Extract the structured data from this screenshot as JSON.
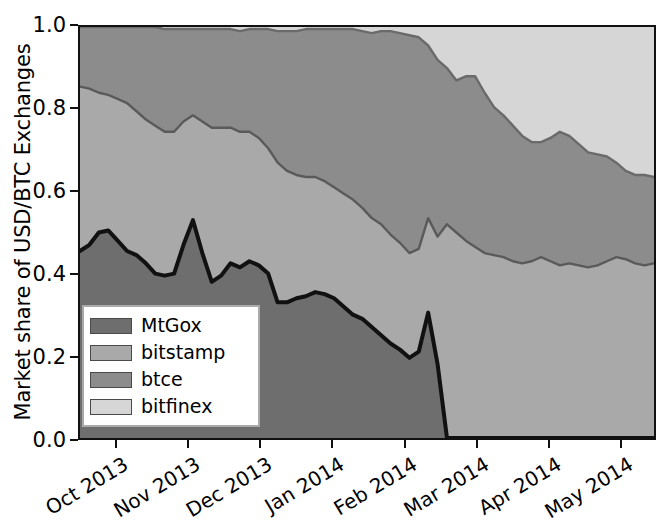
{
  "chart_data": {
    "type": "area",
    "title": "",
    "subtitle": "",
    "xlabel": "",
    "ylabel": "Market share of USD/BTC Exchanges",
    "stacked": true,
    "grid": false,
    "legend_position": "lower-left",
    "ylim": [
      0.0,
      1.0
    ],
    "ytick_labels": [
      "0.0",
      "0.2",
      "0.4",
      "0.6",
      "0.8",
      "1.0"
    ],
    "ytick_values": [
      0.0,
      0.2,
      0.4,
      0.6,
      0.8,
      1.0
    ],
    "xtick_labels": [
      "Oct 2013",
      "Nov 2013",
      "Dec 2013",
      "Jan 2014",
      "Feb 2014",
      "Mar 2014",
      "Apr 2014",
      "May 2014"
    ],
    "x": [
      "2013-09-25",
      "2013-10-01",
      "2013-10-05",
      "2013-10-09",
      "2013-10-13",
      "2013-10-17",
      "2013-10-21",
      "2013-10-25",
      "2013-10-29",
      "2013-11-02",
      "2013-11-06",
      "2013-11-10",
      "2013-11-14",
      "2013-11-18",
      "2013-11-22",
      "2013-11-26",
      "2013-11-30",
      "2013-12-04",
      "2013-12-08",
      "2013-12-12",
      "2013-12-16",
      "2013-12-20",
      "2013-12-24",
      "2013-12-28",
      "2014-01-01",
      "2014-01-05",
      "2014-01-09",
      "2014-01-13",
      "2014-01-17",
      "2014-01-21",
      "2014-01-25",
      "2014-01-29",
      "2014-02-02",
      "2014-02-06",
      "2014-02-10",
      "2014-02-14",
      "2014-02-18",
      "2014-02-22",
      "2014-02-26",
      "2014-03-02",
      "2014-03-06",
      "2014-03-10",
      "2014-03-14",
      "2014-03-18",
      "2014-03-22",
      "2014-03-26",
      "2014-03-30",
      "2014-04-03",
      "2014-04-07",
      "2014-04-11",
      "2014-04-15",
      "2014-04-19",
      "2014-04-23",
      "2014-04-27",
      "2014-05-01",
      "2014-05-05",
      "2014-05-09",
      "2014-05-13",
      "2014-05-17",
      "2014-05-21",
      "2014-05-25",
      "2014-05-29"
    ],
    "series": [
      {
        "name": "MtGox",
        "color": "#6e6e6e",
        "values": [
          0.455,
          0.47,
          0.5,
          0.505,
          0.48,
          0.455,
          0.445,
          0.425,
          0.4,
          0.395,
          0.4,
          0.47,
          0.53,
          0.45,
          0.38,
          0.395,
          0.425,
          0.415,
          0.43,
          0.42,
          0.4,
          0.33,
          0.33,
          0.34,
          0.345,
          0.355,
          0.35,
          0.34,
          0.32,
          0.3,
          0.29,
          0.27,
          0.25,
          0.23,
          0.215,
          0.195,
          0.21,
          0.305,
          0.18,
          0.0,
          0.0,
          0.0,
          0.0,
          0.0,
          0.0,
          0.0,
          0.0,
          0.0,
          0.0,
          0.0,
          0.0,
          0.0,
          0.0,
          0.0,
          0.0,
          0.0,
          0.0,
          0.0,
          0.0,
          0.0,
          0.0,
          0.0
        ]
      },
      {
        "name": "bitstamp",
        "color": "#a9a9a9",
        "values": [
          0.4,
          0.38,
          0.34,
          0.33,
          0.345,
          0.36,
          0.35,
          0.35,
          0.36,
          0.35,
          0.345,
          0.3,
          0.255,
          0.32,
          0.375,
          0.36,
          0.33,
          0.33,
          0.315,
          0.31,
          0.305,
          0.34,
          0.32,
          0.3,
          0.29,
          0.28,
          0.275,
          0.27,
          0.275,
          0.28,
          0.27,
          0.265,
          0.27,
          0.265,
          0.26,
          0.255,
          0.25,
          0.23,
          0.31,
          0.52,
          0.5,
          0.48,
          0.465,
          0.45,
          0.445,
          0.44,
          0.43,
          0.425,
          0.43,
          0.44,
          0.43,
          0.42,
          0.425,
          0.42,
          0.415,
          0.42,
          0.43,
          0.44,
          0.435,
          0.425,
          0.42,
          0.425
        ]
      },
      {
        "name": "btce",
        "color": "#8c8c8c",
        "values": [
          0.145,
          0.15,
          0.16,
          0.165,
          0.175,
          0.185,
          0.205,
          0.225,
          0.24,
          0.25,
          0.25,
          0.225,
          0.21,
          0.225,
          0.24,
          0.24,
          0.24,
          0.245,
          0.25,
          0.265,
          0.29,
          0.32,
          0.34,
          0.35,
          0.36,
          0.36,
          0.37,
          0.385,
          0.4,
          0.415,
          0.43,
          0.45,
          0.47,
          0.495,
          0.51,
          0.53,
          0.515,
          0.42,
          0.43,
          0.38,
          0.37,
          0.4,
          0.415,
          0.39,
          0.36,
          0.345,
          0.33,
          0.31,
          0.29,
          0.28,
          0.3,
          0.325,
          0.31,
          0.295,
          0.28,
          0.27,
          0.255,
          0.23,
          0.215,
          0.215,
          0.22,
          0.21
        ]
      },
      {
        "name": "bitfinex",
        "color": "#d6d6d6",
        "values": [
          0.0,
          0.0,
          0.0,
          0.0,
          0.0,
          0.0,
          0.0,
          0.0,
          0.0,
          0.005,
          0.005,
          0.005,
          0.005,
          0.005,
          0.005,
          0.005,
          0.005,
          0.01,
          0.005,
          0.005,
          0.005,
          0.01,
          0.01,
          0.01,
          0.005,
          0.005,
          0.005,
          0.005,
          0.005,
          0.005,
          0.01,
          0.015,
          0.01,
          0.01,
          0.015,
          0.02,
          0.025,
          0.045,
          0.08,
          0.1,
          0.13,
          0.12,
          0.12,
          0.16,
          0.195,
          0.215,
          0.24,
          0.265,
          0.28,
          0.28,
          0.27,
          0.255,
          0.265,
          0.285,
          0.305,
          0.31,
          0.315,
          0.33,
          0.35,
          0.36,
          0.36,
          0.365
        ]
      }
    ]
  },
  "legend": {
    "entries": [
      {
        "label": "MtGox",
        "color": "#6e6e6e"
      },
      {
        "label": "bitstamp",
        "color": "#a9a9a9"
      },
      {
        "label": "btce",
        "color": "#8c8c8c"
      },
      {
        "label": "bitfinex",
        "color": "#d6d6d6"
      }
    ]
  },
  "axes": {
    "y_label": "Market share of USD/BTC Exchanges",
    "y_ticks": [
      "0.0",
      "0.2",
      "0.4",
      "0.6",
      "0.8",
      "1.0"
    ],
    "x_ticks": [
      "Oct 2013",
      "Nov 2013",
      "Dec 2013",
      "Jan 2014",
      "Feb 2014",
      "Mar 2014",
      "Apr 2014",
      "May 2014"
    ]
  }
}
